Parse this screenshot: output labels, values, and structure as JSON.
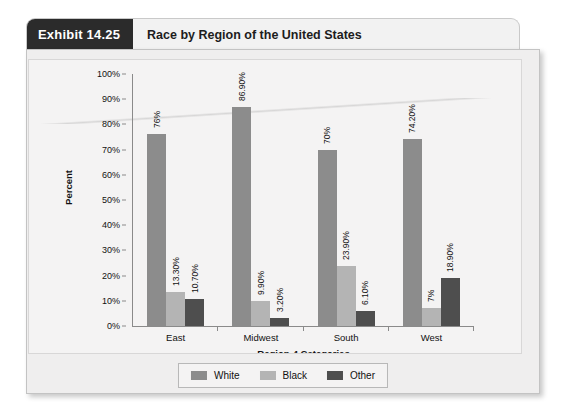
{
  "exhibit": {
    "tab_label": "Exhibit 14.25",
    "title": "Race by Region of the United States"
  },
  "colors": {
    "white_series": "#8c8c8c",
    "black_series": "#b4b4b4",
    "other_series": "#4e4e4e",
    "panel_background": "#efeeee",
    "plot_background": "#f4f3f3",
    "axis": "#8a8a8a",
    "header_tab_background": "#2b2b2b",
    "header_tab_text": "#ffffff"
  },
  "chart_data": {
    "type": "bar",
    "title": "Race by Region of the United States",
    "xlabel": "Region-4 Categories",
    "ylabel": "Percent",
    "categories": [
      "East",
      "Midwest",
      "South",
      "West"
    ],
    "ylim": [
      0,
      100
    ],
    "yticks": [
      "0%",
      "10%",
      "20%",
      "30%",
      "40%",
      "50%",
      "60%",
      "70%",
      "80%",
      "90%",
      "100%"
    ],
    "ytick_values": [
      0,
      10,
      20,
      30,
      40,
      50,
      60,
      70,
      80,
      90,
      100
    ],
    "grid": false,
    "legend_position": "bottom",
    "series": [
      {
        "name": "White",
        "color": "#8c8c8c",
        "values": [
          76,
          86.9,
          70,
          74.2
        ],
        "labels": [
          "76%",
          "86.90%",
          "70%",
          "74.20%"
        ]
      },
      {
        "name": "Black",
        "color": "#b4b4b4",
        "values": [
          13.3,
          9.9,
          23.9,
          7
        ],
        "labels": [
          "13.30%",
          "9.90%",
          "23.90%",
          "7%"
        ]
      },
      {
        "name": "Other",
        "color": "#4e4e4e",
        "values": [
          10.7,
          3.2,
          6.1,
          18.9
        ],
        "labels": [
          "10.70%",
          "3.20%",
          "6.10%",
          "18.90%"
        ]
      }
    ]
  }
}
